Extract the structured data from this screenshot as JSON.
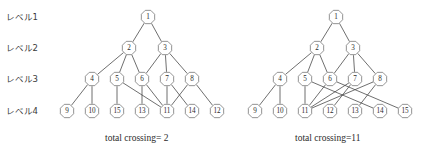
{
  "figure": {
    "title": "",
    "level_labels": [
      {
        "text": "レベル1",
        "y": 16
      },
      {
        "text": "レベル2",
        "y": 47
      },
      {
        "text": "レベル3",
        "y": 78
      },
      {
        "text": "レベル4",
        "y": 110
      }
    ],
    "colors": {
      "background": "#ffffff",
      "node_stroke": "#777777",
      "node_fill": "#ffffff",
      "edge": "#4a4a4a",
      "text": "#2b2b2b",
      "label_text": "#3a3a3a"
    }
  },
  "graphs": [
    {
      "name": "left-graph",
      "caption": "total  crossing= 2",
      "caption_x": 105,
      "caption_y": 133,
      "origin_x": 55,
      "nodes": [
        {
          "id": "1",
          "label": "1",
          "x": 93,
          "y": 17
        },
        {
          "id": "2",
          "label": "2",
          "x": 74,
          "y": 48
        },
        {
          "id": "3",
          "label": "3",
          "x": 110,
          "y": 48
        },
        {
          "id": "4",
          "label": "4",
          "x": 37,
          "y": 79
        },
        {
          "id": "5",
          "label": "5",
          "x": 62,
          "y": 79
        },
        {
          "id": "6",
          "label": "6",
          "x": 87,
          "y": 79
        },
        {
          "id": "7",
          "label": "7",
          "x": 112,
          "y": 79
        },
        {
          "id": "8",
          "label": "8",
          "x": 137,
          "y": 79
        },
        {
          "id": "9",
          "label": "9",
          "x": 12,
          "y": 111
        },
        {
          "id": "10",
          "label": "10",
          "x": 37,
          "y": 111
        },
        {
          "id": "15",
          "label": "15",
          "x": 62,
          "y": 111
        },
        {
          "id": "13",
          "label": "13",
          "x": 87,
          "y": 111
        },
        {
          "id": "11",
          "label": "11",
          "x": 112,
          "y": 111
        },
        {
          "id": "14",
          "label": "14",
          "x": 137,
          "y": 111
        },
        {
          "id": "12",
          "label": "12",
          "x": 162,
          "y": 111
        }
      ],
      "edges": [
        [
          "1",
          "2"
        ],
        [
          "1",
          "3"
        ],
        [
          "2",
          "4"
        ],
        [
          "2",
          "5"
        ],
        [
          "2",
          "6"
        ],
        [
          "3",
          "6"
        ],
        [
          "3",
          "7"
        ],
        [
          "3",
          "8"
        ],
        [
          "4",
          "9"
        ],
        [
          "4",
          "10"
        ],
        [
          "5",
          "15"
        ],
        [
          "5",
          "11"
        ],
        [
          "6",
          "13"
        ],
        [
          "6",
          "11"
        ],
        [
          "7",
          "11"
        ],
        [
          "7",
          "14"
        ],
        [
          "8",
          "11"
        ],
        [
          "8",
          "12"
        ]
      ]
    },
    {
      "name": "right-graph",
      "caption": "total  crossing=11",
      "caption_x": 295,
      "caption_y": 133,
      "origin_x": 243,
      "nodes": [
        {
          "id": "1",
          "label": "1",
          "x": 93,
          "y": 17
        },
        {
          "id": "2",
          "label": "2",
          "x": 74,
          "y": 48
        },
        {
          "id": "3",
          "label": "3",
          "x": 110,
          "y": 48
        },
        {
          "id": "4",
          "label": "4",
          "x": 37,
          "y": 79
        },
        {
          "id": "5",
          "label": "5",
          "x": 62,
          "y": 79
        },
        {
          "id": "6",
          "label": "6",
          "x": 87,
          "y": 79
        },
        {
          "id": "7",
          "label": "7",
          "x": 112,
          "y": 79
        },
        {
          "id": "8",
          "label": "8",
          "x": 137,
          "y": 79
        },
        {
          "id": "9",
          "label": "9",
          "x": 12,
          "y": 111
        },
        {
          "id": "10",
          "label": "10",
          "x": 37,
          "y": 111
        },
        {
          "id": "11",
          "label": "11",
          "x": 62,
          "y": 111
        },
        {
          "id": "12",
          "label": "12",
          "x": 87,
          "y": 111
        },
        {
          "id": "13",
          "label": "13",
          "x": 112,
          "y": 111
        },
        {
          "id": "14",
          "label": "14",
          "x": 137,
          "y": 111
        },
        {
          "id": "15",
          "label": "15",
          "x": 162,
          "y": 111
        }
      ],
      "edges": [
        [
          "1",
          "2"
        ],
        [
          "1",
          "3"
        ],
        [
          "2",
          "4"
        ],
        [
          "2",
          "5"
        ],
        [
          "2",
          "6"
        ],
        [
          "3",
          "6"
        ],
        [
          "3",
          "7"
        ],
        [
          "3",
          "8"
        ],
        [
          "4",
          "9"
        ],
        [
          "4",
          "10"
        ],
        [
          "5",
          "11"
        ],
        [
          "5",
          "14"
        ],
        [
          "6",
          "11"
        ],
        [
          "6",
          "15"
        ],
        [
          "7",
          "11"
        ],
        [
          "7",
          "12"
        ],
        [
          "8",
          "11"
        ],
        [
          "8",
          "13"
        ]
      ]
    }
  ],
  "chart_data": {
    "type": "diagram",
    "levels": [
      "レベル1",
      "レベル2",
      "レベル3",
      "レベル4"
    ],
    "series": [
      {
        "name": "left drawing",
        "crossings": 2,
        "level4_order": [
          "9",
          "10",
          "15",
          "13",
          "11",
          "14",
          "12"
        ]
      },
      {
        "name": "right drawing",
        "crossings": 11,
        "level4_order": [
          "9",
          "10",
          "11",
          "12",
          "13",
          "14",
          "15"
        ]
      }
    ],
    "shared_structure": {
      "level1": [
        "1"
      ],
      "level2": [
        "2",
        "3"
      ],
      "level3": [
        "4",
        "5",
        "6",
        "7",
        "8"
      ],
      "edges": [
        "1-2",
        "1-3",
        "2-4",
        "2-5",
        "2-6",
        "3-6",
        "3-7",
        "3-8",
        "4-9",
        "4-10",
        "5-15",
        "5-11",
        "6-13",
        "6-11",
        "7-11",
        "7-14",
        "8-11",
        "8-12"
      ]
    }
  }
}
